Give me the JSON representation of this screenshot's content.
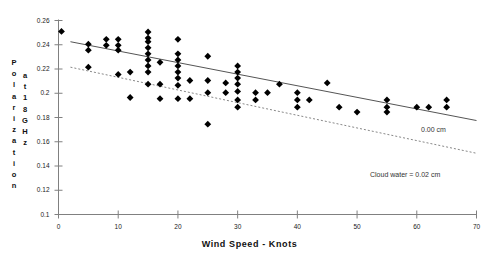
{
  "chart_data": {
    "type": "scatter",
    "title": "",
    "xlabel": "Wind Speed - Knots",
    "ylabel_line1": "Polarization",
    "ylabel_line2": "at 18 GHz",
    "xlim": [
      0,
      70
    ],
    "ylim": [
      0.1,
      0.26
    ],
    "xticks": [
      0,
      10,
      20,
      30,
      40,
      50,
      60,
      70
    ],
    "xticklabels": [
      "0",
      "10",
      "20",
      "30",
      "40",
      "50",
      "60",
      "70"
    ],
    "yticks": [
      0.1,
      0.12,
      0.14,
      0.16,
      0.18,
      0.2,
      0.22,
      0.24,
      0.26
    ],
    "yticklabels": [
      "0.1",
      "0.12",
      "0.14",
      "0.16",
      "0.18",
      "0.2",
      "0.22",
      "0.24",
      "0.26"
    ],
    "grid": false,
    "legend_position": "inline-right",
    "marker": "diamond",
    "marker_color": "#000000",
    "axis_color": "#808080",
    "scatter": {
      "name": "Observations",
      "points": [
        [
          0.5,
          0.251
        ],
        [
          5,
          0.2405
        ],
        [
          5,
          0.2355
        ],
        [
          5,
          0.2215
        ],
        [
          8,
          0.2445
        ],
        [
          8,
          0.2395
        ],
        [
          10,
          0.2445
        ],
        [
          10,
          0.2395
        ],
        [
          10,
          0.2355
        ],
        [
          10,
          0.2155
        ],
        [
          12,
          0.2175
        ],
        [
          12,
          0.1965
        ],
        [
          15,
          0.2505
        ],
        [
          15,
          0.2455
        ],
        [
          15,
          0.2425
        ],
        [
          15,
          0.2375
        ],
        [
          15,
          0.2325
        ],
        [
          15,
          0.2275
        ],
        [
          15,
          0.2225
        ],
        [
          15,
          0.2175
        ],
        [
          15,
          0.2075
        ],
        [
          17,
          0.2255
        ],
        [
          17,
          0.2075
        ],
        [
          17,
          0.1955
        ],
        [
          20,
          0.2445
        ],
        [
          20,
          0.2325
        ],
        [
          20,
          0.2275
        ],
        [
          20,
          0.2225
        ],
        [
          20,
          0.2175
        ],
        [
          20,
          0.2125
        ],
        [
          20,
          0.2065
        ],
        [
          20,
          0.1955
        ],
        [
          22,
          0.2105
        ],
        [
          22,
          0.1955
        ],
        [
          25,
          0.2305
        ],
        [
          25,
          0.2105
        ],
        [
          25,
          0.2005
        ],
        [
          25,
          0.1745
        ],
        [
          28,
          0.2085
        ],
        [
          28,
          0.2005
        ],
        [
          30,
          0.2225
        ],
        [
          30,
          0.2175
        ],
        [
          30,
          0.2125
        ],
        [
          30,
          0.2075
        ],
        [
          30,
          0.2015
        ],
        [
          30,
          0.1945
        ],
        [
          30,
          0.1885
        ],
        [
          33,
          0.2005
        ],
        [
          33,
          0.1945
        ],
        [
          35,
          0.2005
        ],
        [
          37,
          0.2075
        ],
        [
          40,
          0.2005
        ],
        [
          40,
          0.1945
        ],
        [
          40,
          0.1885
        ],
        [
          42,
          0.1945
        ],
        [
          45,
          0.2085
        ],
        [
          47,
          0.1885
        ],
        [
          50,
          0.1845
        ],
        [
          55,
          0.1945
        ],
        [
          55,
          0.1885
        ],
        [
          55,
          0.1845
        ],
        [
          60,
          0.1885
        ],
        [
          62,
          0.1885
        ],
        [
          65,
          0.1945
        ],
        [
          65,
          0.1885
        ]
      ]
    },
    "series_lines": [
      {
        "name": "0.00 cm",
        "label": "0.00 cm",
        "style": "solid",
        "color": "#555555",
        "x0": 2,
        "y0": 0.2425,
        "x1": 70,
        "y1": 0.1775
      },
      {
        "name": "Cloud water = 0.02 cm",
        "label": "Cloud water = 0.02 cm",
        "style": "dashed",
        "color": "#888888",
        "x0": 2,
        "y0": 0.2215,
        "x1": 70,
        "y1": 0.1505
      }
    ]
  }
}
